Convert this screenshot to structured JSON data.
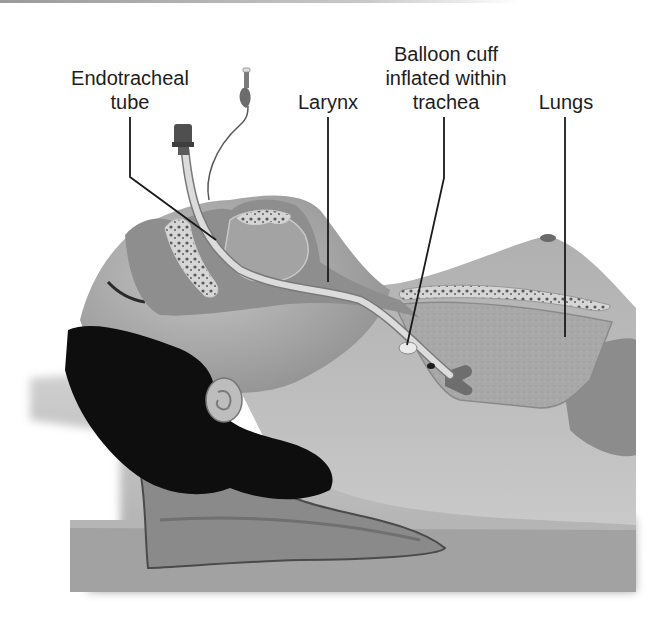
{
  "figure": {
    "colors": {
      "background": "#ffffff",
      "label_text": "#1d1d1d",
      "leader_line": "#1a1a1a",
      "skin": "#b9b9b9",
      "hair": "#0d0d0d",
      "lung": "#a9a9a9",
      "tube": "#d9d9d9",
      "table": "#9e9e9e"
    }
  },
  "labels": [
    {
      "id": "endotracheal-tube",
      "lines": [
        "Endotracheal",
        "tube"
      ]
    },
    {
      "id": "larynx",
      "lines": [
        "Larynx"
      ]
    },
    {
      "id": "balloon-cuff",
      "lines": [
        "Balloon cuff",
        "inflated within",
        "trachea"
      ]
    },
    {
      "id": "lungs",
      "lines": [
        "Lungs"
      ]
    }
  ]
}
